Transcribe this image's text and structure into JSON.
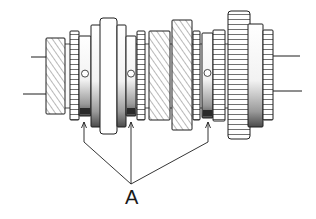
{
  "figure": {
    "background": "#ffffff",
    "ink_color": "#1e1e1e",
    "shade_color": "#555555",
    "callout": {
      "label": "A",
      "label_position": {
        "x": 125,
        "y": 187
      },
      "apex": {
        "x": 131,
        "y": 184
      },
      "targets": [
        {
          "x": 84,
          "y": 122
        },
        {
          "x": 131,
          "y": 122
        },
        {
          "x": 208,
          "y": 122
        }
      ]
    },
    "components": [
      {
        "name": "left-helical-gear",
        "x": 46,
        "y": 38,
        "w": 19,
        "h": 76
      },
      {
        "name": "needle-bearing-1",
        "x": 70,
        "y": 31,
        "w": 9,
        "h": 89
      },
      {
        "name": "synchro-hub-1",
        "x": 79,
        "y": 36,
        "w": 12,
        "h": 80
      },
      {
        "name": "sleeve-1",
        "x": 91,
        "y": 25,
        "w": 12,
        "h": 102
      },
      {
        "name": "center-collar",
        "x": 100,
        "y": 18,
        "w": 17,
        "h": 116
      },
      {
        "name": "sleeve-2",
        "x": 117,
        "y": 25,
        "w": 9,
        "h": 102
      },
      {
        "name": "synchro-hub-2",
        "x": 126,
        "y": 36,
        "w": 10,
        "h": 80
      },
      {
        "name": "needle-bearing-2",
        "x": 137,
        "y": 31,
        "w": 8,
        "h": 89
      },
      {
        "name": "helical-gear-2",
        "x": 149,
        "y": 31,
        "w": 21,
        "h": 89
      },
      {
        "name": "helical-gear-3",
        "x": 172,
        "y": 20,
        "w": 20,
        "h": 110
      },
      {
        "name": "needle-bearing-3",
        "x": 193,
        "y": 31,
        "w": 7,
        "h": 89
      },
      {
        "name": "synchro-hub-3",
        "x": 202,
        "y": 33,
        "w": 11,
        "h": 85
      },
      {
        "name": "spline-ring",
        "x": 213,
        "y": 30,
        "w": 12,
        "h": 91
      },
      {
        "name": "large-spur-gear",
        "x": 228,
        "y": 11,
        "w": 22,
        "h": 128
      },
      {
        "name": "gear-hub",
        "x": 248,
        "y": 24,
        "w": 15,
        "h": 103
      },
      {
        "name": "right-splined-end",
        "x": 263,
        "y": 30,
        "w": 10,
        "h": 90
      }
    ],
    "shaft_lines": [
      {
        "x1": 31,
        "y1": 57,
        "x2": 46,
        "y2": 57
      },
      {
        "x1": 23,
        "y1": 94,
        "x2": 46,
        "y2": 94
      },
      {
        "x1": 273,
        "y1": 56,
        "x2": 300,
        "y2": 56
      },
      {
        "x1": 273,
        "y1": 91,
        "x2": 302,
        "y2": 91
      }
    ]
  }
}
